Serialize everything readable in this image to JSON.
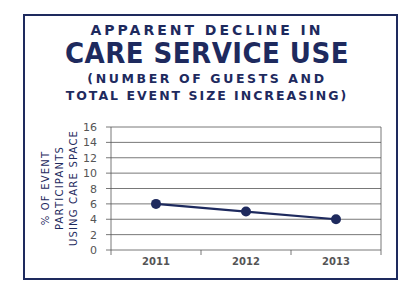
{
  "title": {
    "line1": "APPARENT DECLINE IN",
    "line2": "CARE SERVICE USE",
    "line3_pre": "(NUMBER OF GUESTS ",
    "line3_bold": "AND",
    "line4": "TOTAL EVENT SIZE INCREASING)"
  },
  "colors": {
    "primary": "#1e2a5e",
    "grid": "#555555",
    "tick_text": "#555555"
  },
  "chart_data": {
    "type": "line",
    "xlabel": "",
    "ylabel": "% OF EVENT PARTICIPANTS USING CARE SPACE",
    "categories": [
      "2011",
      "2012",
      "2013"
    ],
    "series": [
      {
        "name": "% using care space",
        "values": [
          6,
          5,
          4
        ]
      }
    ],
    "ylim": [
      0,
      16
    ],
    "yticks": [
      0,
      2,
      4,
      6,
      8,
      10,
      12,
      14,
      16
    ],
    "grid": true,
    "legend": "none"
  },
  "ylabel_lines": [
    "% OF EVENT PARTICIPANTS",
    "USING CARE SPACE"
  ]
}
